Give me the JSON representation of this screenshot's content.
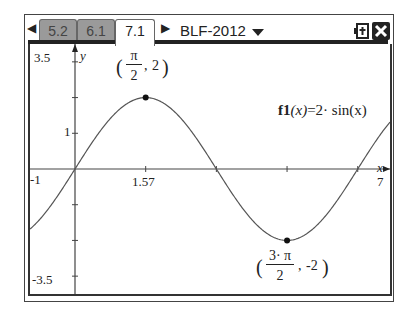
{
  "tabs": [
    {
      "label": "5.2",
      "active": false
    },
    {
      "label": "6.1",
      "active": false
    },
    {
      "label": "7.1",
      "active": true
    }
  ],
  "document_title": "BLF-2012",
  "icons": {
    "left_arrow": "left-arrow-icon",
    "right_arrow": "right-arrow-icon",
    "dropdown": "chevron-down-icon",
    "battery": "battery-icon",
    "close": "close-icon"
  },
  "graph": {
    "function_label_name": "f1",
    "function_label_arg": "(x)",
    "function_label_expr": "=2· sin(x)",
    "x_axis_label": "x",
    "y_axis_label": "y",
    "x_min_label": "-1",
    "x_max_label": "7",
    "y_max_label": "3.5",
    "y_min_label": "-3.5",
    "x_tick_label": "1.57",
    "y_tick_label": "1",
    "max_point": {
      "num": "π",
      "den": "2",
      "y": "2"
    },
    "min_point": {
      "num": "3· π",
      "den": "2",
      "y": "-2"
    }
  },
  "chart_data": {
    "type": "line",
    "xlabel": "x",
    "ylabel": "y",
    "xlim": [
      -1,
      7
    ],
    "ylim": [
      -3.5,
      3.5
    ],
    "x_ticks": [
      1.57
    ],
    "y_ticks": [
      1
    ],
    "function": "2*sin(x)",
    "marked_points": [
      {
        "x": 1.5708,
        "y": 2,
        "label": "(π/2, 2)"
      },
      {
        "x": 4.7124,
        "y": -2,
        "label": "(3·π/2, -2)"
      }
    ]
  }
}
